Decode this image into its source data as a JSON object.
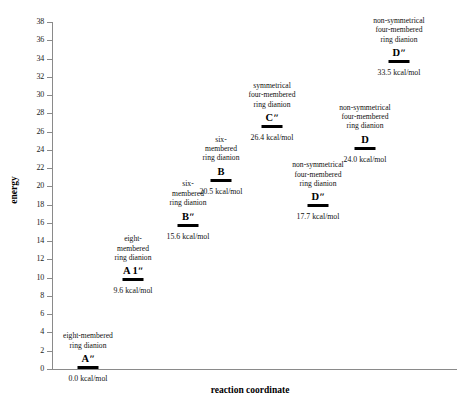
{
  "chart_data": {
    "type": "scatter",
    "title": "",
    "xlabel": "reaction coordinate",
    "ylabel": "energy",
    "ylim": [
      0,
      38
    ],
    "ytick_step": 2,
    "yticks": [
      0,
      2,
      4,
      6,
      8,
      10,
      12,
      14,
      16,
      18,
      20,
      22,
      24,
      26,
      28,
      30,
      32,
      34,
      36,
      38
    ],
    "ytick_labels": [
      "0",
      "2",
      "4",
      "6",
      "8",
      "10",
      "12",
      "14",
      "16",
      "18",
      "20",
      "22",
      "24",
      "26",
      "28",
      "30",
      "32",
      "34",
      "36",
      "38"
    ],
    "grid": false,
    "legend": "none",
    "units": "kcal/mol",
    "points": [
      {
        "name": "Aʺ",
        "value": 0.0,
        "value_label": "0.0 kcal/mol",
        "description_lines": [
          "eight-membered",
          "ring dianion"
        ],
        "x_px": 88,
        "desc_position": "above"
      },
      {
        "name": "A 1ʺ",
        "value": 9.6,
        "value_label": "9.6 kcal/mol",
        "description_lines": [
          "eight-",
          "membered",
          "ring dianion"
        ],
        "x_px": 133,
        "desc_position": "above"
      },
      {
        "name": "Bʺ",
        "value": 15.6,
        "value_label": "15.6 kcal/mol",
        "description_lines": [
          "six-",
          "membered",
          "ring dianion"
        ],
        "x_px": 188,
        "desc_position": "above"
      },
      {
        "name": "B",
        "value": 20.5,
        "value_label": "20.5 kcal/mol",
        "description_lines": [
          "six-",
          "membered",
          "ring dianion"
        ],
        "x_px": 221,
        "desc_position": "above"
      },
      {
        "name": "Cʺ",
        "value": 26.4,
        "value_label": "26.4 kcal/mol",
        "description_lines": [
          "symmetrical",
          "four-membered",
          "ring dianion"
        ],
        "x_px": 272,
        "desc_position": "above"
      },
      {
        "name": "Dʺ",
        "value": 17.7,
        "value_label": "17.7 kcal/mol",
        "description_lines": [
          "non-symmetrical",
          "four-membered",
          "ring dianion"
        ],
        "x_px": 318,
        "desc_position": "above"
      },
      {
        "name": "D",
        "value": 24.0,
        "value_label": "24.0 kcal/mol",
        "description_lines": [
          "non-symmetrical",
          "four-membered",
          "ring dianion"
        ],
        "x_px": 365,
        "desc_position": "above"
      },
      {
        "name": "Dʺ",
        "value": 33.5,
        "value_label": "33.5 kcal/mol",
        "description_lines": [
          "non-symmetrical",
          "four-membered",
          "ring dianion"
        ],
        "x_px": 399,
        "desc_position": "above"
      }
    ]
  },
  "axes": {
    "y_title": "energy",
    "x_title": "reaction coordinate"
  },
  "colors": {
    "bar": "#000000",
    "axis": "#8a8a8a",
    "text": "#111111",
    "background": "#ffffff"
  }
}
